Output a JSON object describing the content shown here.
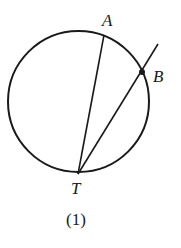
{
  "diagram": {
    "caption": "(1)",
    "circle": {
      "cx": 78.5,
      "cy": 101.5,
      "r": 70.5
    },
    "points": {
      "A": {
        "label": "A",
        "x": 104,
        "y": 35
      },
      "B": {
        "label": "B",
        "x": 142,
        "y": 72
      },
      "T": {
        "label": "T",
        "x": 78,
        "y": 174
      }
    },
    "segments": [
      {
        "name": "TA",
        "from": "T",
        "to": "A"
      },
      {
        "name": "TB-extended",
        "from": "T",
        "to": "B",
        "extends_beyond": true
      }
    ],
    "colors": {
      "stroke": "#1a1a1a",
      "background": "#ffffff"
    }
  }
}
